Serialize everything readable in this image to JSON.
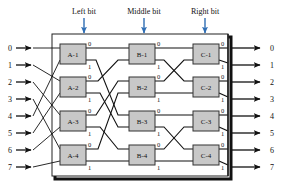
{
  "diagram": {
    "colors": {
      "arrow_blue": "#2E6DB4",
      "box_fill": "#C8C8C8",
      "box_stroke": "#333333",
      "wire": "#111111",
      "frame": "#222222",
      "shadow": "#111111",
      "background": "#FFFFFF"
    },
    "stage_labels": [
      {
        "text": "Left bit",
        "x": 84,
        "y": 12,
        "arrow_x": 84,
        "arrow_y1": 16,
        "arrow_y2": 32
      },
      {
        "text": "Middle bit",
        "x": 144,
        "y": 12,
        "arrow_x": 144,
        "arrow_y1": 16,
        "arrow_y2": 32
      },
      {
        "text": "Right bit",
        "x": 205,
        "y": 12,
        "arrow_x": 205,
        "arrow_y1": 16,
        "arrow_y2": 32
      }
    ],
    "frame": {
      "x": 52,
      "y": 34,
      "w": 176,
      "h": 142
    },
    "switches": [
      {
        "name": "A-1",
        "x": 60,
        "y": 44,
        "w": 26,
        "h": 20,
        "port0": "0",
        "port1": "1"
      },
      {
        "name": "A-2",
        "x": 60,
        "y": 77,
        "w": 26,
        "h": 20,
        "port0": "0",
        "port1": "1"
      },
      {
        "name": "A-3",
        "x": 60,
        "y": 111,
        "w": 26,
        "h": 20,
        "port0": "0",
        "port1": "1"
      },
      {
        "name": "A-4",
        "x": 60,
        "y": 145,
        "w": 26,
        "h": 20,
        "port0": "0",
        "port1": "1"
      },
      {
        "name": "B-1",
        "x": 129,
        "y": 44,
        "w": 26,
        "h": 20,
        "port0": "0",
        "port1": "1"
      },
      {
        "name": "B-2",
        "x": 129,
        "y": 77,
        "w": 26,
        "h": 20,
        "port0": "0",
        "port1": "1"
      },
      {
        "name": "B-3",
        "x": 129,
        "y": 111,
        "w": 26,
        "h": 20,
        "port0": "0",
        "port1": "1"
      },
      {
        "name": "B-4",
        "x": 129,
        "y": 145,
        "w": 26,
        "h": 20,
        "port0": "0",
        "port1": "1"
      },
      {
        "name": "C-1",
        "x": 193,
        "y": 44,
        "w": 26,
        "h": 20,
        "port0": "0",
        "port1": "1"
      },
      {
        "name": "C-2",
        "x": 193,
        "y": 77,
        "w": 26,
        "h": 20,
        "port0": "0",
        "port1": "1"
      },
      {
        "name": "C-3",
        "x": 193,
        "y": 111,
        "w": 26,
        "h": 20,
        "port0": "0",
        "port1": "1"
      },
      {
        "name": "C-4",
        "x": 193,
        "y": 145,
        "w": 26,
        "h": 20,
        "port0": "0",
        "port1": "1"
      }
    ],
    "inputs": [
      {
        "label": "0",
        "y": 48
      },
      {
        "label": "1",
        "y": 65
      },
      {
        "label": "2",
        "y": 82
      },
      {
        "label": "3",
        "y": 99
      },
      {
        "label": "4",
        "y": 116
      },
      {
        "label": "5",
        "y": 133
      },
      {
        "label": "6",
        "y": 150
      },
      {
        "label": "7",
        "y": 167
      }
    ],
    "outputs": [
      {
        "label": "0",
        "y": 48
      },
      {
        "label": "1",
        "y": 65
      },
      {
        "label": "2",
        "y": 82
      },
      {
        "label": "3",
        "y": 99
      },
      {
        "label": "4",
        "y": 116
      },
      {
        "label": "5",
        "y": 133
      },
      {
        "label": "6",
        "y": 150
      },
      {
        "label": "7",
        "y": 167
      }
    ],
    "input_map": [
      "A-1",
      "A-2",
      "A-3",
      "A-4",
      "A-1",
      "A-2",
      "A-3",
      "A-4"
    ],
    "output_map": [
      "C-1",
      "C-1",
      "C-2",
      "C-2",
      "C-3",
      "C-3",
      "C-4",
      "C-4"
    ],
    "stage1_links": [
      {
        "from": "A-1.0",
        "to": "B-1.0"
      },
      {
        "from": "A-1.1",
        "to": "B-3.0"
      },
      {
        "from": "A-2.0",
        "to": "B-1.1"
      },
      {
        "from": "A-2.1",
        "to": "B-3.1"
      },
      {
        "from": "A-3.0",
        "to": "B-2.0"
      },
      {
        "from": "A-3.1",
        "to": "B-4.0"
      },
      {
        "from": "A-4.0",
        "to": "B-2.1"
      },
      {
        "from": "A-4.1",
        "to": "B-4.1"
      }
    ],
    "stage2_links": [
      {
        "from": "B-1.0",
        "to": "C-1.0"
      },
      {
        "from": "B-1.1",
        "to": "C-2.0"
      },
      {
        "from": "B-2.0",
        "to": "C-1.1"
      },
      {
        "from": "B-2.1",
        "to": "C-2.1"
      },
      {
        "from": "B-3.0",
        "to": "C-3.0"
      },
      {
        "from": "B-3.1",
        "to": "C-4.0"
      },
      {
        "from": "B-4.0",
        "to": "C-3.1"
      },
      {
        "from": "B-4.1",
        "to": "C-4.1"
      }
    ]
  }
}
